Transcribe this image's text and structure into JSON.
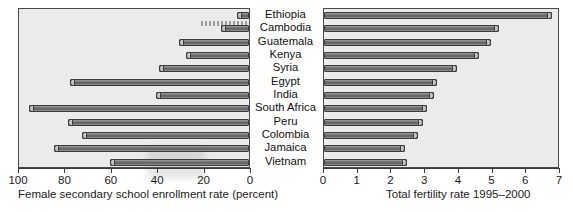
{
  "chart_data": {
    "type": "bar",
    "title": "",
    "orientation": "horizontal",
    "layout": "paired back-to-back horizontal bars",
    "categories": [
      "Ethiopia",
      "Cambodia",
      "Guatemala",
      "Kenya",
      "Syria",
      "Egypt",
      "India",
      "South Africa",
      "Peru",
      "Colombia",
      "Jamaica",
      "Vietnam"
    ],
    "panels": [
      {
        "id": "left",
        "xlabel": "Female secondary school enrollment rate (percent)",
        "ylabel": "",
        "xlim": [
          100,
          0
        ],
        "reversed": true,
        "ticks": [
          100,
          80,
          60,
          40,
          20,
          0
        ],
        "ticklabels": [
          "100",
          "80",
          "60",
          "40",
          "20",
          "0"
        ],
        "grid": false,
        "series": [
          {
            "name": "Female secondary school enrollment rate (percent)",
            "values": [
              5,
              12,
              30,
              27,
              39,
              77,
              40,
              95,
              78,
              72,
              84,
              60
            ]
          }
        ]
      },
      {
        "id": "right",
        "xlabel": "Total fertility rate 1995–2000",
        "ylabel": "",
        "xlim": [
          0,
          7
        ],
        "reversed": false,
        "ticks": [
          0,
          1,
          2,
          3,
          4,
          5,
          6,
          7
        ],
        "ticklabels": [
          "0",
          "1",
          "2",
          "3",
          "4",
          "5",
          "6",
          "7"
        ],
        "grid": false,
        "series": [
          {
            "name": "Total fertility rate 1995–2000",
            "values": [
              6.75,
              5.2,
              4.95,
              4.6,
              3.95,
              3.35,
              3.25,
              3.05,
              2.95,
              2.8,
              2.4,
              2.45
            ]
          }
        ]
      }
    ]
  },
  "colors": {
    "panel_background": "#ebebeb",
    "page_background": "#ffffff",
    "bar_fill": "#6f6f6f",
    "bar_outline": "#3c3c3c",
    "axis": "#3a3a3a",
    "text": "#1a1a1a"
  }
}
